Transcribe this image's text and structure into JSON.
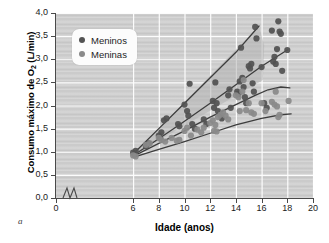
{
  "figure": {
    "panel_label": "a",
    "background_color": "#cfcfcf",
    "frame_color": "#4a4a4a"
  },
  "chart_data": {
    "type": "scatter",
    "title": "",
    "subtitle": "",
    "xlabel": "Idade (anos)",
    "ylabel": "Consumo máximo de O",
    "ylabel_sub": "2",
    "ylabel_unit": " (L/min)",
    "xlim": [
      0,
      20
    ],
    "ylim": [
      0.0,
      4.0
    ],
    "x_ticks": [
      "0",
      "6",
      "8",
      "10",
      "12",
      "14",
      "16",
      "18",
      "20"
    ],
    "x_tick_values": [
      0,
      6,
      8,
      10,
      12,
      14,
      16,
      18,
      20
    ],
    "y_ticks": [
      "0,0",
      "0,5",
      "1,0",
      "1,5",
      "2,0",
      "2,5",
      "3,0",
      "3,5",
      "4,0"
    ],
    "y_tick_values": [
      0.0,
      0.5,
      1.0,
      1.5,
      2.0,
      2.5,
      3.0,
      3.5,
      4.0
    ],
    "axis_break_x": true,
    "axis_break_note": "eixo x interrompido entre 0 e 6",
    "grid": true,
    "grid_color": "#ffffff",
    "legend_position": "top-left",
    "legend": [
      {
        "label": "Meninos",
        "color": "#525252"
      },
      {
        "label": "Meninas",
        "color": "#8a8a8a"
      }
    ],
    "shaded_band": {
      "fill": "#b3b3b3",
      "opacity": 0.55,
      "description": "faixa sombreada entre as linhas de tendência dos meninos",
      "polygon": [
        [
          6,
          0.95
        ],
        [
          15.8,
          3.72
        ],
        [
          16.2,
          3.3
        ],
        [
          16.1,
          2.55
        ],
        [
          6,
          0.92
        ]
      ]
    },
    "trend_lines": [
      {
        "name": "Meninos - limite superior",
        "color": "#3d3d3d",
        "points": [
          [
            6,
            0.95
          ],
          [
            8,
            1.5
          ],
          [
            10,
            2.05
          ],
          [
            12,
            2.6
          ],
          [
            14,
            3.15
          ],
          [
            15.8,
            3.72
          ]
        ]
      },
      {
        "name": "Meninos - linha média",
        "color": "#3d3d3d",
        "points": [
          [
            6,
            0.92
          ],
          [
            8,
            1.28
          ],
          [
            10,
            1.66
          ],
          [
            12,
            2.05
          ],
          [
            14,
            2.45
          ],
          [
            16,
            2.85
          ],
          [
            18,
            3.2
          ]
        ]
      },
      {
        "name": "Meninas - curva superior",
        "color": "#3d3d3d",
        "points": [
          [
            6,
            0.9
          ],
          [
            8,
            1.18
          ],
          [
            10,
            1.45
          ],
          [
            12,
            1.75
          ],
          [
            14,
            2.02
          ],
          [
            15.5,
            2.22
          ],
          [
            16.5,
            2.34
          ],
          [
            17.5,
            2.4
          ],
          [
            18.2,
            2.38
          ]
        ]
      },
      {
        "name": "Meninas - curva inferior",
        "color": "#3d3d3d",
        "points": [
          [
            6,
            0.88
          ],
          [
            8,
            1.05
          ],
          [
            10,
            1.22
          ],
          [
            12,
            1.4
          ],
          [
            14,
            1.58
          ],
          [
            16,
            1.72
          ],
          [
            17.5,
            1.8
          ],
          [
            18.3,
            1.82
          ]
        ]
      }
    ],
    "series": [
      {
        "name": "Meninos",
        "color": "#525252",
        "marker": "circle",
        "points": [
          [
            6.0,
            0.98
          ],
          [
            6.1,
            0.95
          ],
          [
            6.2,
            1.02
          ],
          [
            7.0,
            1.12
          ],
          [
            7.2,
            1.18
          ],
          [
            8.0,
            1.35
          ],
          [
            8.1,
            1.3
          ],
          [
            8.2,
            1.42
          ],
          [
            8.4,
            1.68
          ],
          [
            8.6,
            1.72
          ],
          [
            9.5,
            1.6
          ],
          [
            9.6,
            1.55
          ],
          [
            10.0,
            2.02
          ],
          [
            10.2,
            1.88
          ],
          [
            10.3,
            1.78
          ],
          [
            10.4,
            2.47
          ],
          [
            10.6,
            1.6
          ],
          [
            10.8,
            1.5
          ],
          [
            11.5,
            1.7
          ],
          [
            11.7,
            1.6
          ],
          [
            12.2,
            2.1
          ],
          [
            12.3,
            1.95
          ],
          [
            12.4,
            2.5
          ],
          [
            12.5,
            2.05
          ],
          [
            12.6,
            1.88
          ],
          [
            12.8,
            1.8
          ],
          [
            12.9,
            1.72
          ],
          [
            13.4,
            2.22
          ],
          [
            13.5,
            2.35
          ],
          [
            13.6,
            1.95
          ],
          [
            14.1,
            2.3
          ],
          [
            14.2,
            2.25
          ],
          [
            14.3,
            2.52
          ],
          [
            14.4,
            3.25
          ],
          [
            14.5,
            2.6
          ],
          [
            14.6,
            2.4
          ],
          [
            14.7,
            2.18
          ],
          [
            14.8,
            2.05
          ],
          [
            15.0,
            2.85
          ],
          [
            15.1,
            2.8
          ],
          [
            15.2,
            2.9
          ],
          [
            15.3,
            2.48
          ],
          [
            15.4,
            2.3
          ],
          [
            15.5,
            3.7
          ],
          [
            15.6,
            3.45
          ],
          [
            16.0,
            2.83
          ],
          [
            16.2,
            2.05
          ],
          [
            16.4,
            1.95
          ],
          [
            16.8,
            3.62
          ],
          [
            16.9,
            2.95
          ],
          [
            17.0,
            3.05
          ],
          [
            17.1,
            2.9
          ],
          [
            17.2,
            3.22
          ],
          [
            17.3,
            3.82
          ],
          [
            17.4,
            3.6
          ],
          [
            17.5,
            3.55
          ],
          [
            17.6,
            2.75
          ],
          [
            18.0,
            3.2
          ]
        ]
      },
      {
        "name": "Meninas",
        "color": "#8a8a8a",
        "marker": "circle",
        "points": [
          [
            6.0,
            0.92
          ],
          [
            6.2,
            0.9
          ],
          [
            7.0,
            1.15
          ],
          [
            7.3,
            1.18
          ],
          [
            8.0,
            1.3
          ],
          [
            8.2,
            1.25
          ],
          [
            8.5,
            1.22
          ],
          [
            9.0,
            1.3
          ],
          [
            9.4,
            1.24
          ],
          [
            9.6,
            1.26
          ],
          [
            10.0,
            1.45
          ],
          [
            10.2,
            1.52
          ],
          [
            10.5,
            1.35
          ],
          [
            11.0,
            1.48
          ],
          [
            11.3,
            1.42
          ],
          [
            11.5,
            1.52
          ],
          [
            12.0,
            1.62
          ],
          [
            12.2,
            1.68
          ],
          [
            12.3,
            1.45
          ],
          [
            12.4,
            1.58
          ],
          [
            12.5,
            1.44
          ],
          [
            12.6,
            1.75
          ],
          [
            12.8,
            1.8
          ],
          [
            13.0,
            1.85
          ],
          [
            13.2,
            1.78
          ],
          [
            13.4,
            1.7
          ],
          [
            14.0,
            2.22
          ],
          [
            14.2,
            2.18
          ],
          [
            14.3,
            1.88
          ],
          [
            14.5,
            2.3
          ],
          [
            14.6,
            2.55
          ],
          [
            14.8,
            1.9
          ],
          [
            15.0,
            2.05
          ],
          [
            15.2,
            1.85
          ],
          [
            15.4,
            1.82
          ],
          [
            16.0,
            2.05
          ],
          [
            16.3,
            1.88
          ],
          [
            16.8,
            2.08
          ],
          [
            17.0,
            2.02
          ],
          [
            17.1,
            2.3
          ],
          [
            17.2,
            1.98
          ],
          [
            17.3,
            1.75
          ],
          [
            17.4,
            1.8
          ],
          [
            18.1,
            2.1
          ]
        ]
      }
    ]
  }
}
